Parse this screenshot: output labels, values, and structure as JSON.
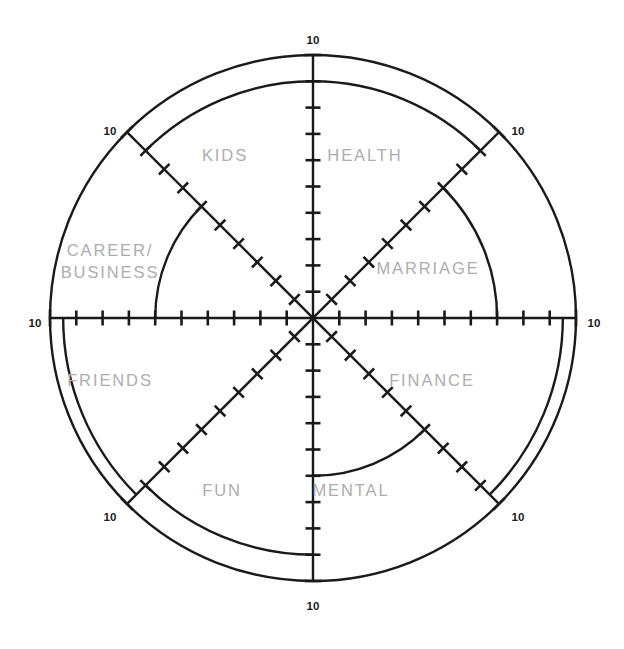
{
  "chart_data": {
    "type": "radar",
    "scale_max": 10,
    "scale_min": 0,
    "ticks_per_axis": 10,
    "grid": false,
    "legend": false,
    "axis_end_label": "10",
    "categories": [
      "HEALTH",
      "MARRIAGE",
      "FINANCE",
      "MENTAL",
      "FUN",
      "FRIENDS",
      "CAREER/BUSINESS",
      "KIDS"
    ],
    "series": [
      {
        "name": "Current Score",
        "values": [
          9,
          7,
          9.5,
          6,
          9,
          9.5,
          6,
          9
        ]
      }
    ],
    "sectors": [
      {
        "id": "health",
        "label": "HEALTH",
        "label_lines": [
          "HEALTH"
        ],
        "value": 9,
        "start_deg": 270,
        "end_deg": 315,
        "label_x": 365,
        "label_y": 161
      },
      {
        "id": "marriage",
        "label": "MARRIAGE",
        "label_lines": [
          "MARRIAGE"
        ],
        "value": 7,
        "start_deg": 315,
        "end_deg": 360,
        "label_x": 428,
        "label_y": 274
      },
      {
        "id": "finance",
        "label": "FINANCE",
        "label_lines": [
          "FINANCE"
        ],
        "value": 9.5,
        "start_deg": 0,
        "end_deg": 45,
        "label_x": 432,
        "label_y": 386
      },
      {
        "id": "mental",
        "label": "MENTAL",
        "label_lines": [
          "MENTAL"
        ],
        "value": 6,
        "start_deg": 45,
        "end_deg": 90,
        "label_x": 351,
        "label_y": 496
      },
      {
        "id": "fun",
        "label": "FUN",
        "label_lines": [
          "FUN"
        ],
        "value": 9,
        "start_deg": 90,
        "end_deg": 135,
        "label_x": 222,
        "label_y": 496
      },
      {
        "id": "friends",
        "label": "FRIENDS",
        "label_lines": [
          "FRIENDS"
        ],
        "value": 9.5,
        "start_deg": 135,
        "end_deg": 180,
        "label_x": 110,
        "label_y": 386
      },
      {
        "id": "career",
        "label": "CAREER/BUSINESS",
        "label_lines": [
          "CAREER/",
          "BUSINESS"
        ],
        "value": 6,
        "start_deg": 180,
        "end_deg": 225,
        "label_x": 110,
        "label_y": 256
      },
      {
        "id": "kids",
        "label": "KIDS",
        "label_lines": [
          "KIDS"
        ],
        "value": 9,
        "start_deg": 225,
        "end_deg": 270,
        "label_x": 225,
        "label_y": 161
      }
    ],
    "axis_endpoint_labels": [
      {
        "id": "top",
        "text": "10",
        "x": 313,
        "y": 44
      },
      {
        "id": "upper-right",
        "text": "10",
        "x": 518,
        "y": 135
      },
      {
        "id": "right",
        "text": "10",
        "x": 594,
        "y": 327
      },
      {
        "id": "lower-right",
        "text": "10",
        "x": 518,
        "y": 521
      },
      {
        "id": "bottom",
        "text": "10",
        "x": 313,
        "y": 610
      },
      {
        "id": "lower-left",
        "text": "10",
        "x": 110,
        "y": 521
      },
      {
        "id": "left",
        "text": "10",
        "x": 35,
        "y": 327
      },
      {
        "id": "upper-left",
        "text": "10",
        "x": 110,
        "y": 135
      }
    ],
    "geometry": {
      "center_x": 313,
      "center_y": 318,
      "radius": 263,
      "axis_count": 8
    },
    "colors": {
      "line": "#1a1a1a",
      "sector_label": "#adadad",
      "scale_label": "#1a1a1a",
      "background": "#ffffff"
    }
  }
}
